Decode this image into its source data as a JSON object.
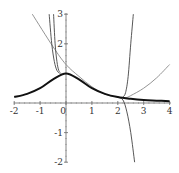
{
  "chart_data": {
    "type": "line",
    "title": "",
    "xlabel": "",
    "ylabel": "",
    "xlim": [
      -2,
      4
    ],
    "ylim": [
      -2,
      3
    ],
    "grid": false,
    "legend": null,
    "x_ticks": [
      "-2",
      "-1",
      "0",
      "1",
      "2",
      "3",
      "4"
    ],
    "y_ticks": [
      "3",
      "2",
      "-1",
      "-2"
    ],
    "series": [
      {
        "name": "f(x) (bold bell curve)",
        "style": "thick-black",
        "x": [
          -2,
          -1.5,
          -1,
          -0.5,
          0,
          0.5,
          1,
          1.5,
          2,
          2.5,
          3,
          3.5,
          4
        ],
        "y": [
          0.2,
          0.31,
          0.5,
          0.8,
          1.0,
          0.8,
          0.5,
          0.31,
          0.2,
          0.14,
          0.1,
          0.08,
          0.06
        ]
      },
      {
        "name": "approximation (shallow gray curve)",
        "style": "thin-gray",
        "x": [
          -1.3,
          -0.5,
          0,
          0.5,
          1,
          1.5,
          2,
          2.3,
          2.5,
          3,
          3.5,
          4
        ],
        "y": [
          3.0,
          1.9,
          1.3,
          0.9,
          0.55,
          0.3,
          0.2,
          0.18,
          0.25,
          0.5,
          0.85,
          1.3
        ]
      },
      {
        "name": "approximation (steep left 1)",
        "style": "thin-dark",
        "x": [
          -0.65,
          -0.55,
          -0.45,
          -0.35,
          -0.25
        ],
        "y": [
          3.0,
          2.0,
          1.4,
          1.1,
          1.0
        ]
      },
      {
        "name": "approximation (steep left 2)",
        "style": "thin-dark",
        "x": [
          -0.48,
          -0.42,
          -0.35,
          -0.28,
          -0.2
        ],
        "y": [
          3.0,
          2.0,
          1.4,
          1.1,
          1.0
        ]
      },
      {
        "name": "approximation (steep right up)",
        "style": "thin-dark",
        "x": [
          2.2,
          2.3,
          2.4,
          2.5,
          2.6
        ],
        "y": [
          0.2,
          0.35,
          0.9,
          2.0,
          3.0
        ]
      },
      {
        "name": "approximation (steep right down)",
        "style": "thin-dark",
        "x": [
          2.0,
          2.2,
          2.35,
          2.5,
          2.65
        ],
        "y": [
          0.2,
          0.1,
          -0.3,
          -1.0,
          -2.0
        ]
      }
    ]
  }
}
